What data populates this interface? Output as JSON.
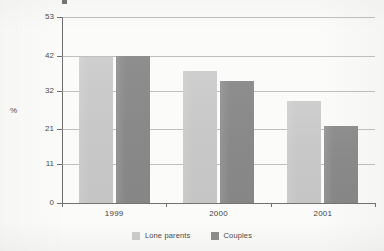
{
  "chart_data": {
    "type": "bar",
    "title": "",
    "xlabel": "",
    "ylabel": "%",
    "categories": [
      "1999",
      "2000",
      "2001"
    ],
    "series": [
      {
        "name": "Lone parents",
        "color": "#c9c9c9",
        "values": [
          41.5,
          37.5,
          29.0
        ]
      },
      {
        "name": "Couples",
        "color": "#8a8a8a",
        "values": [
          41.8,
          34.7,
          22.0
        ]
      }
    ],
    "ylim": [
      0,
      53
    ],
    "yticks": [
      0,
      11,
      21,
      32,
      42,
      53
    ],
    "ytick_labels": [
      "0",
      "11",
      "21",
      "32",
      "42",
      "53"
    ],
    "grid": true,
    "legend_position": "bottom"
  },
  "axis": {
    "unit_label": "%",
    "tick_labels": [
      "53",
      "42",
      "32",
      "21",
      "11",
      "0"
    ],
    "category_labels": [
      "1999",
      "2000",
      "2001"
    ]
  },
  "legend": {
    "items": [
      {
        "label": "Lone parents",
        "swatch": "light-grey-swatch"
      },
      {
        "label": "Couples",
        "swatch": "dark-grey-swatch"
      }
    ]
  },
  "colors": {
    "lone_parents": "#c9c9c9",
    "couples": "#8a8a8a",
    "gridline": "#9a9a9a",
    "axis": "#6e6e6e",
    "text": "#4a4a4a",
    "background": "#fbfbfa"
  }
}
